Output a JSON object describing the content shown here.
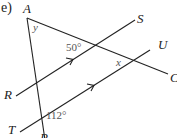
{
  "part_label": "e)",
  "points": {
    "A": "A",
    "S": "S",
    "U": "U",
    "C": "C",
    "R": "R",
    "T": "T",
    "P": "P"
  },
  "angles": {
    "y": "y",
    "angle_50": "50°",
    "x": "x",
    "angle_112": "112°"
  },
  "colors": {
    "line": "#222222",
    "background": "#ffffff"
  }
}
